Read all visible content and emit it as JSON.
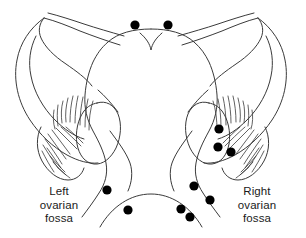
{
  "figure": {
    "type": "anatomical-line-diagram",
    "background_color": "#ffffff",
    "outline_color": "#3a3a3a",
    "marker_color": "#000000"
  },
  "labels": {
    "left": {
      "line1": "Left",
      "line2": "ovarian",
      "line3": "fossa"
    },
    "right": {
      "line1": "Right",
      "line2": "ovarian",
      "line3": "fossa"
    }
  },
  "markers": {
    "description": "Filled black dots marking deposit sites",
    "radius": 4.6,
    "color": "#000000",
    "groups": [
      {
        "name": "fundus-superior",
        "count": 2,
        "points": [
          {
            "x": 135,
            "y": 25
          },
          {
            "x": 168,
            "y": 25
          }
        ]
      },
      {
        "name": "right-ovary",
        "count": 3,
        "points": [
          {
            "x": 219,
            "y": 129
          },
          {
            "x": 218,
            "y": 147
          },
          {
            "x": 231,
            "y": 152
          }
        ]
      },
      {
        "name": "left-pelvic-floor",
        "count": 2,
        "points": [
          {
            "x": 107,
            "y": 190
          },
          {
            "x": 128,
            "y": 210
          }
        ]
      },
      {
        "name": "right-pelvic-floor",
        "count": 4,
        "points": [
          {
            "x": 194,
            "y": 186
          },
          {
            "x": 210,
            "y": 200
          },
          {
            "x": 181,
            "y": 209
          },
          {
            "x": 190,
            "y": 217
          }
        ]
      }
    ]
  },
  "structures": [
    {
      "name": "uterine-fundus",
      "side": "center"
    },
    {
      "name": "uterine-body",
      "side": "center"
    },
    {
      "name": "cervix",
      "side": "center"
    },
    {
      "name": "vaginal-fornix",
      "side": "center"
    },
    {
      "name": "fallopian-tube",
      "side": "left"
    },
    {
      "name": "fallopian-tube",
      "side": "right"
    },
    {
      "name": "broad-ligament",
      "side": "left"
    },
    {
      "name": "broad-ligament",
      "side": "right"
    },
    {
      "name": "ovary",
      "side": "left"
    },
    {
      "name": "ovary",
      "side": "right"
    },
    {
      "name": "fimbriae",
      "side": "left"
    },
    {
      "name": "fimbriae",
      "side": "right"
    },
    {
      "name": "mesosalpinx-hatching",
      "side": "left"
    },
    {
      "name": "mesosalpinx-hatching",
      "side": "right"
    }
  ]
}
